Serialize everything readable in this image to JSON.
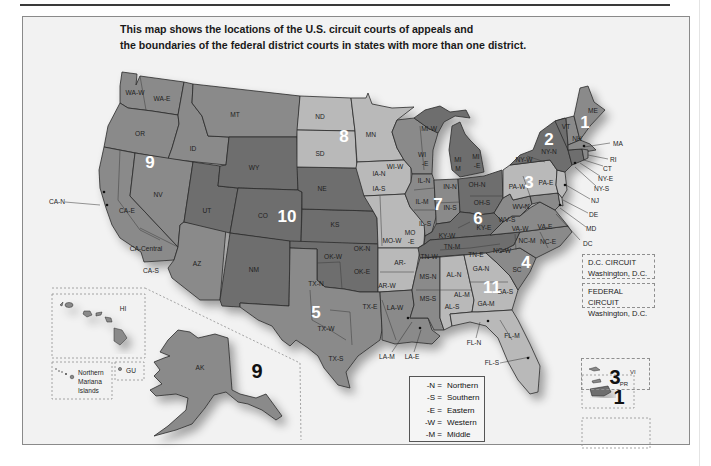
{
  "title": {
    "line1": "This map shows the locations of the U.S. circuit courts of appeals and",
    "line2": "the boundaries of the federal district courts in states with more than one district."
  },
  "colors": {
    "background": "#f2f2f2",
    "circuit_dark": "#6e6e6e",
    "circuit_mid": "#8a8a8a",
    "circuit_light": "#b9b9b9",
    "border": "#2b2b2b"
  },
  "circuits": [
    {
      "number": "1",
      "states": [
        "ME",
        "NH",
        "MA",
        "RI",
        "PR"
      ]
    },
    {
      "number": "2",
      "states": [
        "NY-N",
        "NY-W",
        "NY-E",
        "NY-S",
        "VT",
        "CT"
      ]
    },
    {
      "number": "3",
      "states": [
        "PA-W",
        "PA-E",
        "NJ",
        "DE",
        "VI"
      ]
    },
    {
      "number": "4",
      "states": [
        "WV-N",
        "WV-S",
        "VA-W",
        "VA-E",
        "MD",
        "NC-W",
        "NC-M",
        "NC-E",
        "SC"
      ]
    },
    {
      "number": "5",
      "states": [
        "TX-N",
        "TX-E",
        "TX-W",
        "TX-S",
        "LA-W",
        "LA-M",
        "LA-E",
        "MS-N",
        "MS-S"
      ]
    },
    {
      "number": "6",
      "states": [
        "MI-W",
        "MI-E",
        "OH-N",
        "OH-S",
        "KY-W",
        "KY-E",
        "TN-W",
        "TN-M",
        "TN-E"
      ]
    },
    {
      "number": "7",
      "states": [
        "WI-W",
        "WI-E",
        "IL-N",
        "IL-M",
        "IL-S",
        "IN-N",
        "IN-S"
      ]
    },
    {
      "number": "8",
      "states": [
        "ND",
        "SD",
        "MN",
        "IA-N",
        "IA-S",
        "MO-W",
        "MO-E",
        "AR-W",
        "AR-E",
        "NE"
      ]
    },
    {
      "number": "9",
      "states": [
        "WA-W",
        "WA-E",
        "OR",
        "ID",
        "MT",
        "NV",
        "CA-N",
        "CA-E",
        "CA-Central",
        "CA-S",
        "AZ",
        "AK",
        "HI",
        "GU",
        "Northern Mariana Islands"
      ]
    },
    {
      "number": "10",
      "states": [
        "WY",
        "UT",
        "CO",
        "KS",
        "OK-N",
        "OK-W",
        "OK-E",
        "NM"
      ]
    },
    {
      "number": "11",
      "states": [
        "AL-N",
        "AL-M",
        "AL-S",
        "GA-N",
        "GA-M",
        "GA-S",
        "FL-N",
        "FL-M",
        "FL-S"
      ]
    }
  ],
  "labels": {
    "wa_w": "WA-W",
    "wa_e": "WA-E",
    "or": "OR",
    "id": "ID",
    "mt": "MT",
    "nv": "NV",
    "ca_n": "CA-N",
    "ca_e": "CA-E",
    "ca_central": "CA-Central",
    "ca_s": "CA-S",
    "az": "AZ",
    "ut": "UT",
    "wy": "WY",
    "co": "CO",
    "nm": "NM",
    "nd": "ND",
    "sd": "SD",
    "ne": "NE",
    "ks": "KS",
    "mn": "MN",
    "ia_n": "IA-N",
    "ia_s": "IA-S",
    "mo_w": "MO-W",
    "mo_e": "MO\n-E",
    "mo_e1": "MO",
    "mo_e2": "-E",
    "ar_e": "AR-",
    "ar_w": "AR-W",
    "ok_n": "OK-N",
    "ok_w": "OK-W",
    "ok_e": "OK-E",
    "tx_n": "TX-N",
    "tx_e": "TX-E",
    "tx_w": "TX-W",
    "tx_s": "TX-S",
    "la_w": "LA-W",
    "la_m": "LA-M",
    "la_e": "LA-E",
    "wi_w": "WI-W",
    "wi_e1": "WI",
    "wi_e2": "-E",
    "mi_w": "MI-W",
    "mi_m1": "MI",
    "mi_m2": "M",
    "mi_e1": "MI",
    "mi_e2": "-E",
    "il_n": "IL-N",
    "il_m": "IL-M",
    "il_s": "IL-S",
    "in_n": "IN-N",
    "in_s": "IN-S",
    "oh_n": "OH-N",
    "oh_s": "OH-S",
    "ky_w": "KY-W",
    "ky_e": "KY-E",
    "tn_w": "TN-W",
    "tn_m": "TN-M",
    "tn_e": "TN-E",
    "ms_n": "MS-N",
    "ms_s": "MS-S",
    "al_n": "AL-N",
    "al_m": "AL-M",
    "al_s": "AL-S",
    "ga_n": "GA-N",
    "ga_m": "GA-M",
    "ga_s": "GA-S",
    "fl_n": "FL-N",
    "fl_m": "FL-M",
    "fl_s": "FL-S",
    "sc": "SC",
    "nc_w": "NC-W",
    "nc_m": "NC-M",
    "nc_e": "NC-E",
    "va_w": "VA-W",
    "va_e": "VA-E",
    "wv_n": "WV-N",
    "wv_s": "WV-S",
    "pa_w": "PA-W",
    "pa_e": "PA-E",
    "ny_w": "NY-W",
    "ny_n": "NY-N",
    "vt": "VT",
    "nh": "NH",
    "me": "ME",
    "ma": "MA",
    "ri": "RI",
    "ct": "CT",
    "ny_e": "NY-E",
    "ny_s": "NY-S",
    "nj": "NJ",
    "de": "DE",
    "md": "MD",
    "dc": "DC",
    "hi": "HI",
    "ak": "AK",
    "gu": "GU",
    "pr": "PR",
    "vi": "VI",
    "nmi1": "Northern",
    "nmi2": "Mariana",
    "nmi3": "Islands"
  },
  "circuit_numbers": {
    "c1": "1",
    "c2": "2",
    "c3": "3",
    "c4": "4",
    "c5": "5",
    "c6": "6",
    "c7": "7",
    "c8": "8",
    "c9": "9",
    "c9_ak": "9",
    "c10": "10",
    "c11": "11",
    "c1_pr": "1",
    "c3_vi": "3"
  },
  "special_circuits": {
    "dc": {
      "name": "D.C. CIRCUIT",
      "location": "Washington, D.C."
    },
    "federal": {
      "name": "FEDERAL CIRCUIT",
      "location": "Washington, D.C."
    }
  },
  "legend": {
    "items": [
      {
        "code": "-N =",
        "meaning": "Northern"
      },
      {
        "code": "-S =",
        "meaning": "Southern"
      },
      {
        "code": "-E =",
        "meaning": "Eastern"
      },
      {
        "code": "-W =",
        "meaning": "Western"
      },
      {
        "code": "-M =",
        "meaning": "Middle"
      }
    ]
  }
}
